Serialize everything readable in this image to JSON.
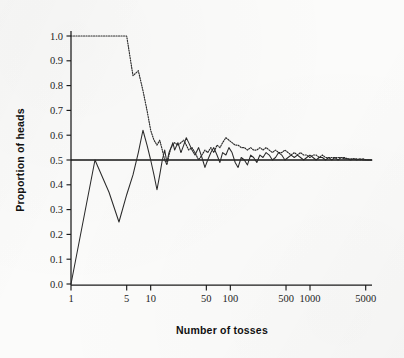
{
  "figure": {
    "background_color": "#fbfbfa",
    "ink_color": "#2a2a2a"
  },
  "chart_data": {
    "type": "line",
    "title": "",
    "subtitle": "",
    "xlabel": "Number of tosses",
    "ylabel": "Proportion of heads",
    "xscale": "log",
    "yscale": "linear",
    "xlim": [
      1,
      6000
    ],
    "ylim": [
      0.0,
      1.0
    ],
    "grid": false,
    "legend": "none",
    "annotations": [
      {
        "name": "reference-line",
        "kind": "horizontal-line",
        "y": 0.5,
        "label": "",
        "style": "solid"
      }
    ],
    "xticks": [
      1,
      5,
      10,
      50,
      100,
      500,
      1000,
      5000
    ],
    "xtick_labels": [
      "1",
      "5",
      "10",
      "50",
      "100",
      "500",
      "1000",
      "5000"
    ],
    "yticks": [
      0.0,
      0.1,
      0.2,
      0.3,
      0.4,
      0.5,
      0.6,
      0.7,
      0.8,
      0.9,
      1.0
    ],
    "ytick_labels": [
      "0.0",
      "0.1",
      "0.2",
      "0.3",
      "0.4",
      "0.5",
      "0.6",
      "0.7",
      "0.8",
      "0.9",
      "1.0"
    ],
    "series": [
      {
        "name": "Run 1",
        "style": "solid",
        "x": [
          1,
          2,
          3,
          4,
          5,
          6,
          7,
          8,
          9,
          10,
          11,
          12,
          13,
          14,
          15,
          16,
          17,
          18,
          19,
          20,
          22,
          24,
          26,
          28,
          30,
          33,
          36,
          40,
          44,
          48,
          52,
          57,
          62,
          68,
          74,
          80,
          88,
          96,
          105,
          115,
          125,
          137,
          150,
          164,
          180,
          196,
          215,
          235,
          257,
          281,
          308,
          337,
          369,
          404,
          442,
          484,
          530,
          580,
          635,
          695,
          760,
          832,
          911,
          997,
          1091,
          1194,
          1307,
          1431,
          1566,
          1714,
          1876,
          2054,
          2248,
          2461,
          2693,
          2948,
          3227,
          3532,
          3866,
          4232,
          4632,
          5069,
          5500,
          6000
        ],
        "y": [
          0.0,
          0.5,
          0.37,
          0.25,
          0.36,
          0.44,
          0.53,
          0.62,
          0.56,
          0.5,
          0.44,
          0.38,
          0.44,
          0.5,
          0.54,
          0.49,
          0.53,
          0.55,
          0.57,
          0.54,
          0.57,
          0.53,
          0.56,
          0.59,
          0.57,
          0.54,
          0.52,
          0.55,
          0.51,
          0.47,
          0.5,
          0.53,
          0.55,
          0.52,
          0.49,
          0.53,
          0.52,
          0.55,
          0.53,
          0.49,
          0.47,
          0.51,
          0.5,
          0.48,
          0.52,
          0.51,
          0.49,
          0.52,
          0.51,
          0.53,
          0.52,
          0.5,
          0.51,
          0.53,
          0.52,
          0.5,
          0.51,
          0.52,
          0.51,
          0.52,
          0.51,
          0.5,
          0.51,
          0.52,
          0.51,
          0.5,
          0.51,
          0.51,
          0.5,
          0.51,
          0.5,
          0.51,
          0.5,
          0.51,
          0.505,
          0.505,
          0.5,
          0.505,
          0.5,
          0.505,
          0.5,
          0.5,
          0.5,
          0.5
        ]
      },
      {
        "name": "Run 2",
        "style": "dotted",
        "x": [
          1,
          2,
          3,
          4,
          5,
          6,
          7,
          8,
          9,
          10,
          11,
          12,
          13,
          14,
          15,
          16,
          17,
          18,
          19,
          20,
          22,
          24,
          26,
          28,
          30,
          33,
          36,
          40,
          44,
          48,
          52,
          57,
          62,
          68,
          74,
          80,
          88,
          96,
          105,
          115,
          125,
          137,
          150,
          164,
          180,
          196,
          215,
          235,
          257,
          281,
          308,
          337,
          369,
          404,
          442,
          484,
          530,
          580,
          635,
          695,
          760,
          832,
          911,
          997,
          1091,
          1194,
          1307,
          1431,
          1566,
          1714,
          1876,
          2054,
          2248,
          2461,
          2693,
          2948,
          3227,
          3532,
          3866,
          4232,
          4632,
          5069,
          5500,
          6000
        ],
        "y": [
          1.0,
          1.0,
          1.0,
          1.0,
          1.0,
          0.84,
          0.86,
          0.78,
          0.7,
          0.62,
          0.58,
          0.56,
          0.58,
          0.54,
          0.5,
          0.48,
          0.52,
          0.55,
          0.56,
          0.57,
          0.56,
          0.57,
          0.58,
          0.56,
          0.54,
          0.55,
          0.53,
          0.5,
          0.52,
          0.54,
          0.53,
          0.55,
          0.53,
          0.56,
          0.55,
          0.57,
          0.59,
          0.58,
          0.57,
          0.56,
          0.56,
          0.55,
          0.55,
          0.54,
          0.55,
          0.54,
          0.54,
          0.55,
          0.54,
          0.55,
          0.54,
          0.53,
          0.54,
          0.53,
          0.53,
          0.54,
          0.53,
          0.52,
          0.53,
          0.52,
          0.53,
          0.52,
          0.52,
          0.51,
          0.52,
          0.52,
          0.51,
          0.52,
          0.51,
          0.51,
          0.51,
          0.51,
          0.51,
          0.51,
          0.51,
          0.505,
          0.505,
          0.505,
          0.505,
          0.5,
          0.505,
          0.5,
          0.5,
          0.5
        ]
      }
    ]
  }
}
